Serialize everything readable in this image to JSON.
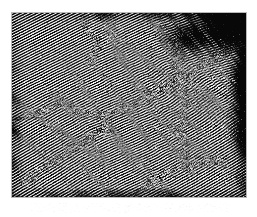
{
  "figure": {
    "kind": "micrograph",
    "technique": "HRTEM lattice-fringe image",
    "caption": "",
    "alt_description": "High-resolution transmission electron micrograph showing nanocrystalline lattice fringes in several differently oriented grains separated by grain boundaries, with a dark amorphous region at the upper right.",
    "frame": {
      "x": 11,
      "y": 12,
      "width": 236,
      "height": 186,
      "border_color": "#b9b9b9",
      "background_color": "#0b0b0b"
    },
    "page_background_color": "#ffffff",
    "fringe_color_light": "#f2f2f2",
    "fringe_color_dark": "#080808",
    "render": {
      "seed": 20246,
      "fringe_period_px": 2.55,
      "grain_count": 9,
      "speckle_density": 0.16,
      "edge_vignette": true
    },
    "grains": [
      {
        "name": "grain-main-upper-left",
        "cx": 0.28,
        "cy": 0.3,
        "radius": 0.52,
        "angle_deg": 63,
        "period": 2.5,
        "contrast": 1.0,
        "phase": 0.0
      },
      {
        "name": "grain-lower-left",
        "cx": 0.16,
        "cy": 0.8,
        "radius": 0.34,
        "angle_deg": 58,
        "period": 2.6,
        "contrast": 0.95,
        "phase": 0.4
      },
      {
        "name": "grain-center",
        "cx": 0.5,
        "cy": 0.55,
        "radius": 0.3,
        "angle_deg": 69,
        "period": 2.45,
        "contrast": 0.92,
        "phase": 1.1
      },
      {
        "name": "grain-center-right",
        "cx": 0.7,
        "cy": 0.42,
        "radius": 0.28,
        "angle_deg": 52,
        "period": 2.7,
        "contrast": 0.88,
        "phase": 2.0
      },
      {
        "name": "grain-upper-right",
        "cx": 0.82,
        "cy": 0.2,
        "radius": 0.26,
        "angle_deg": 74,
        "period": 2.4,
        "contrast": 0.7,
        "phase": 0.7
      },
      {
        "name": "grain-lower-right",
        "cx": 0.78,
        "cy": 0.78,
        "radius": 0.3,
        "angle_deg": 60,
        "period": 2.55,
        "contrast": 0.9,
        "phase": 1.7
      },
      {
        "name": "grain-bottom-center",
        "cx": 0.46,
        "cy": 0.92,
        "radius": 0.26,
        "angle_deg": 64,
        "period": 2.5,
        "contrast": 0.93,
        "phase": 2.6
      },
      {
        "name": "grain-top-center",
        "cx": 0.52,
        "cy": 0.08,
        "radius": 0.24,
        "angle_deg": 66,
        "period": 2.5,
        "contrast": 0.85,
        "phase": 1.4
      },
      {
        "name": "grain-right-edge",
        "cx": 0.95,
        "cy": 0.58,
        "radius": 0.22,
        "angle_deg": 56,
        "period": 2.6,
        "contrast": 0.8,
        "phase": 0.2
      }
    ],
    "amorphous_regions": [
      {
        "name": "amorphous-top-right-corner",
        "cx": 0.93,
        "cy": 0.07,
        "rx": 0.14,
        "ry": 0.12,
        "darkness": 0.86
      },
      {
        "name": "amorphous-right-edge-band",
        "cx": 0.99,
        "cy": 0.45,
        "rx": 0.05,
        "ry": 0.4,
        "darkness": 0.55
      },
      {
        "name": "amorphous-upper-right-blob",
        "cx": 0.78,
        "cy": 0.12,
        "rx": 0.1,
        "ry": 0.09,
        "darkness": 0.5
      }
    ],
    "boundaries": [
      {
        "name": "boundary-diagonal-main",
        "points": [
          [
            0.02,
            0.58
          ],
          [
            0.2,
            0.5
          ],
          [
            0.38,
            0.56
          ],
          [
            0.52,
            0.5
          ],
          [
            0.66,
            0.4
          ],
          [
            0.8,
            0.3
          ],
          [
            0.94,
            0.18
          ]
        ]
      },
      {
        "name": "boundary-lower-left",
        "points": [
          [
            0.05,
            0.92
          ],
          [
            0.18,
            0.8
          ],
          [
            0.3,
            0.7
          ],
          [
            0.4,
            0.62
          ]
        ]
      },
      {
        "name": "boundary-right-vertical",
        "points": [
          [
            0.72,
            0.12
          ],
          [
            0.7,
            0.3
          ],
          [
            0.74,
            0.48
          ],
          [
            0.72,
            0.66
          ],
          [
            0.76,
            0.86
          ]
        ]
      },
      {
        "name": "boundary-bottom-right",
        "points": [
          [
            0.52,
            0.98
          ],
          [
            0.64,
            0.88
          ],
          [
            0.76,
            0.82
          ],
          [
            0.9,
            0.8
          ]
        ]
      },
      {
        "name": "boundary-upper-center",
        "points": [
          [
            0.3,
            0.04
          ],
          [
            0.36,
            0.16
          ],
          [
            0.34,
            0.28
          ]
        ]
      }
    ]
  }
}
